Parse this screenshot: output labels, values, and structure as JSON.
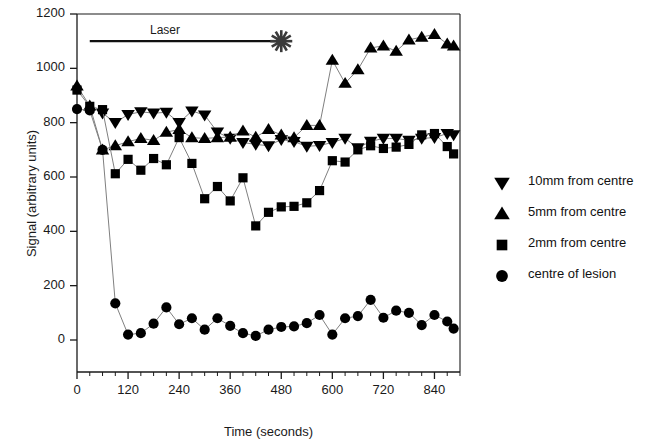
{
  "chart_data": {
    "type": "scatter",
    "title": "",
    "xlabel": "Time (seconds)",
    "ylabel": "Signal (arbitrary units)",
    "xlim": [
      0,
      900
    ],
    "ylim": [
      0,
      1200
    ],
    "xticks": [
      0,
      120,
      240,
      360,
      480,
      600,
      720,
      840
    ],
    "yticks": [
      0,
      200,
      400,
      600,
      800,
      1000,
      1200
    ],
    "xtick_labels": [
      "0",
      "120",
      "240",
      "360",
      "480",
      "600",
      "720",
      "840"
    ],
    "ytick_labels": [
      "0",
      "200",
      "400",
      "600",
      "800",
      "1000",
      "1200"
    ],
    "x_minor_tick_step": 30,
    "grid": false,
    "legend_position": "right",
    "annotations": [
      {
        "name": "laser-duration-bar",
        "label": "Laser",
        "x_start": 30,
        "x_end": 480,
        "y": 1100,
        "end_marker": "starburst"
      }
    ],
    "series": [
      {
        "name": "10mm from centre",
        "marker": "triangle-down",
        "color": "#000000",
        "x": [
          60,
          90,
          120,
          150,
          180,
          210,
          240,
          270,
          300,
          330,
          360,
          390,
          420,
          450,
          480,
          510,
          540,
          570,
          600,
          630,
          660,
          690,
          720,
          750,
          780,
          810,
          840,
          870,
          885
        ],
        "y": [
          835,
          800,
          830,
          840,
          835,
          838,
          800,
          843,
          828,
          765,
          742,
          727,
          720,
          715,
          738,
          730,
          713,
          716,
          727,
          742,
          707,
          731,
          742,
          742,
          735,
          742,
          745,
          760,
          755
        ]
      },
      {
        "name": "5mm from centre",
        "marker": "triangle-up",
        "color": "#000000",
        "x": [
          0,
          30,
          60,
          90,
          120,
          150,
          180,
          210,
          240,
          270,
          300,
          330,
          360,
          390,
          420,
          450,
          480,
          510,
          540,
          570,
          600,
          630,
          660,
          690,
          720,
          750,
          780,
          810,
          840,
          870,
          885
        ],
        "y": [
          935,
          862,
          700,
          715,
          730,
          742,
          735,
          765,
          775,
          745,
          742,
          745,
          747,
          770,
          747,
          775,
          755,
          745,
          790,
          790,
          1030,
          945,
          995,
          1075,
          1083,
          1063,
          1105,
          1115,
          1125,
          1090,
          1083
        ],
        "note": "rises sharply after laser ends"
      },
      {
        "name": "2mm from centre",
        "marker": "square",
        "color": "#000000",
        "x": [
          0,
          30,
          60,
          90,
          120,
          150,
          180,
          210,
          240,
          270,
          300,
          330,
          360,
          390,
          420,
          450,
          480,
          510,
          540,
          570,
          600,
          630,
          660,
          690,
          720,
          750,
          780,
          810,
          840,
          870,
          885
        ],
        "y": [
          920,
          860,
          848,
          612,
          665,
          625,
          668,
          645,
          745,
          650,
          520,
          565,
          512,
          597,
          420,
          470,
          490,
          492,
          505,
          550,
          660,
          655,
          700,
          715,
          705,
          710,
          720,
          755,
          760,
          712,
          685
        ]
      },
      {
        "name": "centre of lesion",
        "marker": "circle",
        "color": "#000000",
        "x": [
          0,
          30,
          60,
          90,
          120,
          150,
          180,
          210,
          240,
          270,
          300,
          330,
          360,
          390,
          420,
          450,
          480,
          510,
          540,
          570,
          600,
          630,
          660,
          690,
          720,
          750,
          780,
          810,
          840,
          870,
          885
        ],
        "y": [
          850,
          845,
          700,
          135,
          20,
          25,
          60,
          120,
          58,
          80,
          38,
          80,
          52,
          25,
          15,
          38,
          48,
          50,
          62,
          92,
          20,
          80,
          88,
          148,
          82,
          108,
          100,
          55,
          92,
          68,
          42
        ]
      }
    ]
  },
  "legend": {
    "items": [
      {
        "label": "10mm from centre",
        "marker": "triangle-down"
      },
      {
        "label": "5mm from centre",
        "marker": "triangle-up"
      },
      {
        "label": "2mm from centre",
        "marker": "square"
      },
      {
        "label": "centre of lesion",
        "marker": "circle"
      }
    ]
  },
  "colors": {
    "marker": "#000000",
    "line": "#808080",
    "axis": "#1a1a1a",
    "text": "#1a1a1a"
  }
}
